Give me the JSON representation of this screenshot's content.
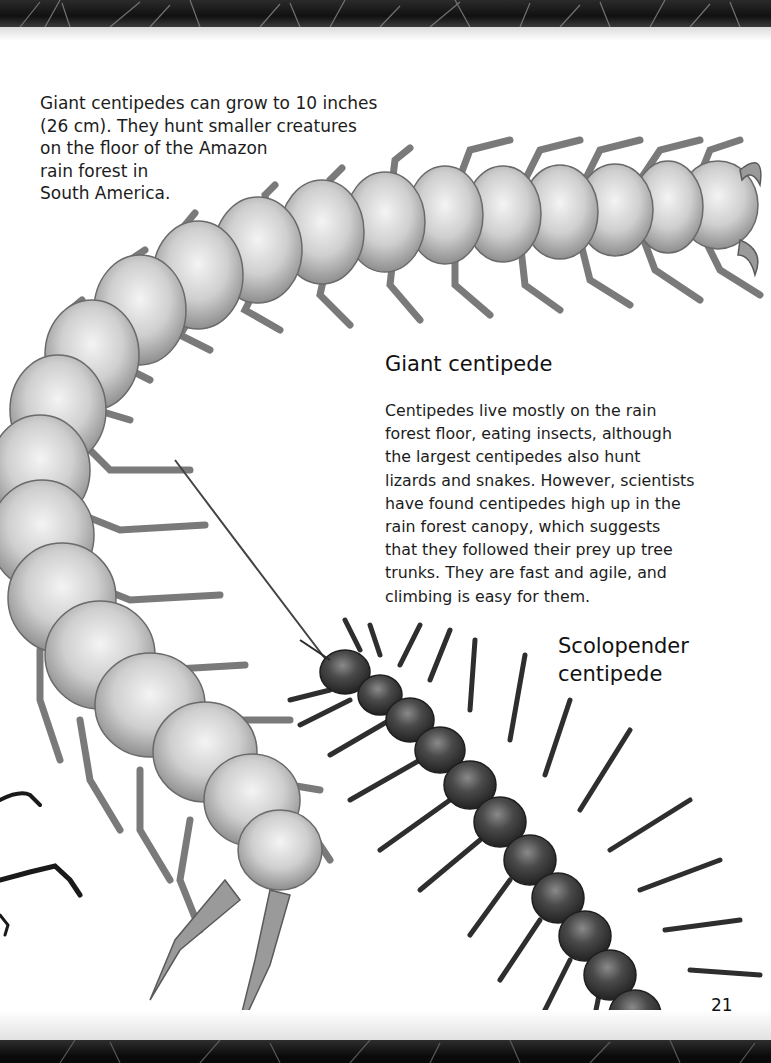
{
  "page": {
    "page_number": "21",
    "caption": {
      "lines": [
        "Giant centipedes can grow to 10 inches",
        "(26 cm). They hunt smaller creatures",
        "on the floor of the Amazon",
        "rain forest in",
        "South America."
      ],
      "text": "Giant centipedes can grow to 10 inches\n(26 cm). They hunt smaller creatures\non the floor of the Amazon\nrain forest in\nSouth America."
    },
    "giant_centipede": {
      "heading": "Giant centipede",
      "body": "Centipedes live mostly on the rain\nforest floor, eating insects, although\nthe largest centipedes also hunt\nlizards and snakes. However, scientists\nhave found centipedes high up in the\nrain forest canopy, which suggests\nthat they followed their prey up tree\ntrunks. They are fast and agile, and\nclimbing is easy for them."
    },
    "scolopender_centipede": {
      "heading": "Scolopender\ncentipede"
    },
    "illustrations": [
      {
        "name": "giant-centipede-illustration",
        "tone": "pale grey"
      },
      {
        "name": "scolopender-centipede-illustration",
        "tone": "dark grey"
      },
      {
        "name": "beetle-legs-partial",
        "tone": "dark"
      }
    ],
    "colors": {
      "background": "#ffffff",
      "text": "#1c1c1c",
      "giant_segment": "#c9c9c9",
      "scolo_segment": "#4a4a4a",
      "band": "#111111"
    }
  }
}
